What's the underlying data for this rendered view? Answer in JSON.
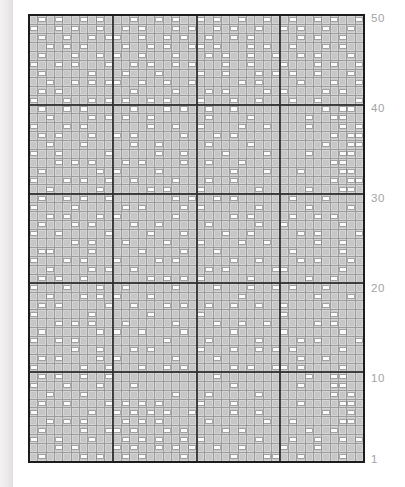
{
  "chart_data": {
    "type": "heatmap",
    "title": "",
    "description_of_symbols": "gray square cell and white horizontal dash cell",
    "columns": 40,
    "rows": 50,
    "bold_grid_every": 10,
    "row_labels": [
      50,
      40,
      30,
      20,
      10,
      1
    ],
    "knit_char": ".",
    "purl_char": "-",
    "grid_order": "top row (row 50) first, bottom row (row 1) last",
    "grid": [
      ".-.-..-.-...-..-.-..-.-..-..-..-..-.-..-",
      "-..-.-..-..-.-...-.-..-.-..-..-.-..-..-.",
      ".-..-..-.--..-..-.-..-..-.-.....-.-..-..",
      "..-.-.-....-..-.-..--.-...-.-..-...-.-..",
      ".-...-..-.-..-...-...-.-..-..-..-.-...-.",
      "-..-.-...-..-.-..-.-...-..-...-...-.-..-",
      ".-.....-...-...-....-..-...-.-.-..-...-.",
      "..-..-.-.--..-..-..-.....-.-....-...-..-",
      ".-.-........-....-...-.-....-.-....-.-..",
      "-...-..-.-.-..-.-...-...-..-...-..-....-",
      ".-..-.-.....-...-.-..-..-..........-.--.",
      "..-....-.-.-..-......-....-......-..--.",
      "-...-.-.......-..-..-....-..-....-...-.-",
      ".-.-...-..-.-.....-...-.-...........-.--",
      "..-...-.....-..-.....-....-........-..--.",
      "-..-.....-.....-..-....-....-....-...--.",
      "...-.-.-...-.-....-..-...-..........--..",
      ".-......-.-....-........-...-...-....--.",
      "-...-.-..-..-....-...-..-...........-.--.",
      "..-.....-.....-.-...-......-.....-...--.",
      ".-..-.-..-.......-.-..-.-......-...-....",
      "-....-.....-.-....-.-......-.....-....-.",
      "..-.-...-.-......-......-.-....-..-.-...",
      ".-...-.-....-..-.....-.....-..-......-..",
      "-..-.....-....-...-....-..-.....-.-....-",
      ".....-.-...-....-...-....-..-.....-..-..",
      ".--....-.....-....-...-........-.....-..",
      "-...-.-...-....-.-......-..-....-.-...-.",
      "..-....-.-..-........-.-.....--......-..",
      ".-.-..-.......-.-.-.-.....-......-..-...",
      "-...-...-..-.....-....-...-..-.-...-....",
      "..-...-.-.-...-..........-........-...-.-",
      ".-.-.....-..-...-.-..-..-..-..-....-....",
      "-......-......-.....-.........-.....-.",
      "...-.-.-...-.....-....-..-..-.....-.-...",
      ".-......-.-..-....-.....-.....-......-..",
      "-..-.-..........-....-.....-....-.-....-",
      ".....-..-...-.-.....-...-..-.-.-.....-..",
      ".-.-....-.-......-....-.........-..-...",
      "-.....-..-...-..-.-.....-.-..--.-....-..",
      ".-.-..-..-............-..........-..--.",
      "-...-...-...-...........-.......-...--.",
      "..-...-..........-...-.....-........-.-.",
      ".-..-....-.-.-.-....-...-.......-....--.",
      "-......-..-.-.-.-..-....-..-.......-..-.",
      "..-.-.-....-.-.-.....-......-..-.....--.",
      ".-....-..--.-...-.-....-.-.......-..-...",
      "-..-...-...-.-.-..-.-......-...-..-..-.-",
      "...-.-....-.-..-.-.-..-..-....-...-.....",
      ".-....-.-..-.-....-.....-...--..-....-.."
    ],
    "colors": {
      "page_bg": "#ffffff",
      "edge_strip": "#ebe9e9",
      "cell_gray": "#c7c7c7",
      "gridline": "#9c9c9c",
      "dash_white": "#fafafa",
      "bold_line": "#2e2e2e",
      "outer_border": "#1c1c1c",
      "label_text": "#a3a3a3"
    }
  }
}
